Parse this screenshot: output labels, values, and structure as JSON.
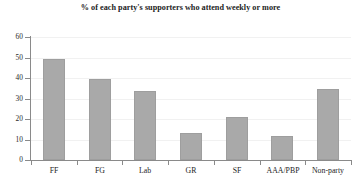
{
  "chart_data": {
    "type": "bar",
    "title": "% of each party's supporters who attend weekly or more",
    "xlabel": "",
    "ylabel": "",
    "categories": [
      "FF",
      "FG",
      "Lab",
      "GR",
      "SF",
      "AAA/PBP",
      "Non-party"
    ],
    "values": [
      49.5,
      39.5,
      33.5,
      13.0,
      21.0,
      11.8,
      34.8
    ],
    "ylim": [
      0,
      60
    ],
    "yticks": [
      0,
      10,
      20,
      30,
      40,
      50,
      60
    ],
    "ytick_labels": [
      "0",
      "10",
      "20",
      "30",
      "40",
      "50",
      "60"
    ],
    "grid": true,
    "legend": false,
    "bar_color": "#a9a9a9",
    "axis_color": "#8a8a8a",
    "gridline_color": "#f1f1f1",
    "background": "#ffffff"
  }
}
